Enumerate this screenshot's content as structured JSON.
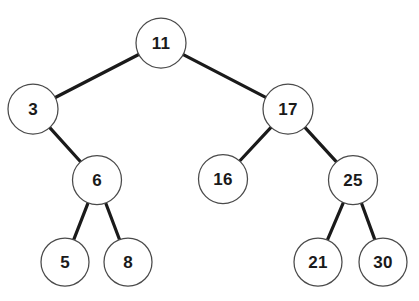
{
  "diagram": {
    "type": "binary-tree",
    "background_color": "#ffffff",
    "node_fill_color": "#ffffff",
    "node_stroke_color": "#4a4a4a",
    "edge_color": "#1a1a1a",
    "label_color": "#1a1a1a",
    "node_radius": 24.5,
    "canvas": {
      "width": 419,
      "height": 301
    },
    "nodes": [
      {
        "id": "n11",
        "label": "11",
        "x": 161,
        "y": 43,
        "r": 25,
        "level": 0
      },
      {
        "id": "n3",
        "label": "3",
        "x": 33,
        "y": 109,
        "r": 25,
        "level": 1
      },
      {
        "id": "n17",
        "label": "17",
        "x": 288,
        "y": 109,
        "r": 25,
        "level": 1
      },
      {
        "id": "n6",
        "label": "6",
        "x": 97,
        "y": 180,
        "r": 24.5,
        "level": 2
      },
      {
        "id": "n16",
        "label": "16",
        "x": 223,
        "y": 179,
        "r": 24.5,
        "level": 2
      },
      {
        "id": "n25",
        "label": "25",
        "x": 353,
        "y": 180,
        "r": 24.5,
        "level": 2
      },
      {
        "id": "n5",
        "label": "5",
        "x": 65,
        "y": 262,
        "r": 24,
        "level": 3
      },
      {
        "id": "n8",
        "label": "8",
        "x": 128,
        "y": 262,
        "r": 24,
        "level": 3
      },
      {
        "id": "n21",
        "label": "21",
        "x": 318,
        "y": 262,
        "r": 24,
        "level": 3
      },
      {
        "id": "n30",
        "label": "30",
        "x": 383,
        "y": 262,
        "r": 24,
        "level": 3
      }
    ],
    "edges": [
      {
        "id": "e11-3",
        "from": "n11",
        "to": "n3",
        "side": "left"
      },
      {
        "id": "e11-17",
        "from": "n11",
        "to": "n17",
        "side": "right"
      },
      {
        "id": "e3-6",
        "from": "n3",
        "to": "n6",
        "side": "right"
      },
      {
        "id": "e6-5",
        "from": "n6",
        "to": "n5",
        "side": "left"
      },
      {
        "id": "e6-8",
        "from": "n6",
        "to": "n8",
        "side": "right"
      },
      {
        "id": "e17-16",
        "from": "n17",
        "to": "n16",
        "side": "left"
      },
      {
        "id": "e17-25",
        "from": "n17",
        "to": "n25",
        "side": "right"
      },
      {
        "id": "e25-21",
        "from": "n25",
        "to": "n21",
        "side": "left"
      },
      {
        "id": "e25-30",
        "from": "n25",
        "to": "n30",
        "side": "right"
      }
    ]
  }
}
